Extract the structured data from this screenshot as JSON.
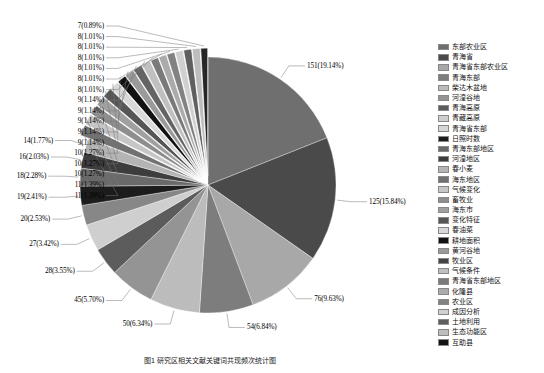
{
  "chart_data": {
    "type": "pie",
    "title": "",
    "xlabel": "",
    "ylabel": "",
    "total": 789,
    "legend_position": "right",
    "grid": false,
    "categories": [
      "东部农业区",
      "青海省",
      "青海省东部农业区",
      "青海东部",
      "柴达木盆地",
      "河湟谷地",
      "青海高原",
      "青藏高原",
      "青海省东部",
      "日照时数",
      "青海东部地区",
      "河湟地区",
      "春小麦",
      "海东地区",
      "气候变化",
      "畜牧业",
      "海东市",
      "变化特征",
      "春油菜",
      "耕地面积",
      "黄河谷地",
      "牧业区",
      "气候条件",
      "青海省东部地区",
      "化隆县",
      "农业区",
      "成因分析",
      "土地利用",
      "生态功能区",
      "互助县"
    ],
    "values": [
      151,
      125,
      76,
      54,
      50,
      45,
      28,
      27,
      20,
      19,
      18,
      16,
      14,
      11,
      11,
      10,
      10,
      10,
      9,
      9,
      9,
      9,
      9,
      8,
      8,
      8,
      8,
      8,
      8,
      7
    ],
    "percent_labels": [
      "151(19.14%)",
      "125(15.84%)",
      "76(9.63%)",
      "54(6.84%)",
      "50(6.34%)",
      "45(5.70%)",
      "28(3.55%)",
      "27(3.42%)",
      "20(2.53%)",
      "19(2.41%)",
      "18(2.28%)",
      "16(2.03%)",
      "14(1.77%)",
      "11(1.39%)",
      "11(1.39%)",
      "10(1.27%)",
      "10(1.27%)",
      "10(1.27%)",
      "9(1.14%)",
      "9(1.14%)",
      "9(1.14%)",
      "9(1.14%)",
      "9(1.14%)",
      "8(1.01%)",
      "8(1.01%)",
      "8(1.01%)",
      "8(1.01%)",
      "8(1.01%)",
      "8(1.01%)",
      "7(0.89%)"
    ],
    "slice_colors": [
      "#6f6f6f",
      "#4a4a4a",
      "#a8a8a8",
      "#7d7d7d",
      "#bcbcbc",
      "#949494",
      "#5c5c5c",
      "#cfcfcf",
      "#878787",
      "#1c1c1c",
      "#6a6a6a",
      "#3d3d3d",
      "#b4b4b4",
      "#717171",
      "#c6c6c6",
      "#8e8e8e",
      "#a0a0a0",
      "#565656",
      "#d8d8d8",
      "#111111",
      "#9a9a9a",
      "#646464",
      "#c0c0c0",
      "#7a7a7a",
      "#ababab",
      "#828282",
      "#d0d0d0",
      "#5f5f5f",
      "#bdbdbd",
      "#262626"
    ],
    "extra_small_labels": [
      "7(0.89%)",
      "7(0.89%)",
      "7(0.89%)",
      "7(0.89%)",
      "7(0.89%)",
      "7(0.89%)"
    ]
  },
  "legend": {
    "items": [
      {
        "label": "东部农业区",
        "color": "#6f6f6f"
      },
      {
        "label": "青海省",
        "color": "#4a4a4a"
      },
      {
        "label": "青海省东部农业区",
        "color": "#a8a8a8"
      },
      {
        "label": "青海东部",
        "color": "#7d7d7d"
      },
      {
        "label": "柴达木盆地",
        "color": "#bcbcbc"
      },
      {
        "label": "河湟谷地",
        "color": "#949494"
      },
      {
        "label": "青海高原",
        "color": "#5c5c5c"
      },
      {
        "label": "青藏高原",
        "color": "#cfcfcf"
      },
      {
        "label": "青海省东部",
        "color": "#d6d6d6"
      },
      {
        "label": "日照时数",
        "color": "#1c1c1c"
      },
      {
        "label": "青海东部地区",
        "color": "#6a6a6a"
      },
      {
        "label": "河湟地区",
        "color": "#3d3d3d"
      },
      {
        "label": "春小麦",
        "color": "#b4b4b4"
      },
      {
        "label": "海东地区",
        "color": "#717171"
      },
      {
        "label": "气候变化",
        "color": "#c6c6c6"
      },
      {
        "label": "畜牧业",
        "color": "#8e8e8e"
      },
      {
        "label": "海东市",
        "color": "#a0a0a0"
      },
      {
        "label": "变化特征",
        "color": "#565656"
      },
      {
        "label": "春油菜",
        "color": "#d8d8d8"
      },
      {
        "label": "耕地面积",
        "color": "#111111"
      },
      {
        "label": "黄河谷地",
        "color": "#9a9a9a"
      },
      {
        "label": "牧业区",
        "color": "#444444"
      },
      {
        "label": "气候条件",
        "color": "#c0c0c0"
      },
      {
        "label": "青海省东部地区",
        "color": "#7a7a7a"
      },
      {
        "label": "化隆县",
        "color": "#ababab"
      },
      {
        "label": "农业区",
        "color": "#828282"
      },
      {
        "label": "成因分析",
        "color": "#d0d0d0"
      },
      {
        "label": "土地利用",
        "color": "#5f5f5f"
      },
      {
        "label": "生态功能区",
        "color": "#bdbdbd"
      },
      {
        "label": "互助县",
        "color": "#141414"
      }
    ]
  },
  "caption": {
    "text": "图1  研究区相关文献关键词共现频次统计图"
  }
}
